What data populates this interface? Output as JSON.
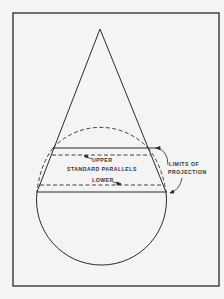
{
  "diagram": {
    "labels": {
      "upper": "UPPER",
      "standard_parallels": "STANDARD PARALLELS",
      "lower": "LOWER",
      "limits_line1": "LIMITS OF",
      "limits_line2": "PROJECTION"
    },
    "colors": {
      "background": "#f4f4f2",
      "ink": "#2a2a2a"
    }
  }
}
